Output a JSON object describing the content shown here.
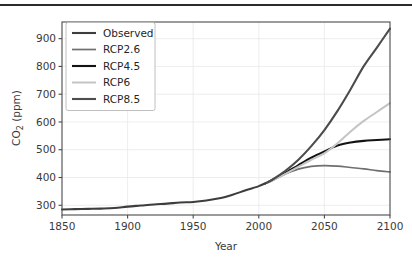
{
  "figure": {
    "background_color": "#ffffff",
    "top_rule_color": "#2b2b2b"
  },
  "chart_data": {
    "type": "line",
    "title": "",
    "xlabel": "Year",
    "ylabel": "CO₂ (ppm)",
    "xlim": [
      1850,
      2100
    ],
    "ylim": [
      265,
      960
    ],
    "xticks": [
      1850,
      1900,
      1950,
      2000,
      2050,
      2100
    ],
    "xticklabels": [
      "1850",
      "1900",
      "1950",
      "2000",
      "2050",
      "2100"
    ],
    "yticks": [
      300,
      400,
      500,
      600,
      700,
      800,
      900
    ],
    "yticklabels": [
      "300",
      "400",
      "500",
      "600",
      "700",
      "800",
      "900"
    ],
    "grid": true,
    "grid_color": "#e9e9e9",
    "legend_position": "upper left",
    "x": [
      1850,
      1860,
      1870,
      1880,
      1890,
      1900,
      1910,
      1920,
      1930,
      1940,
      1950,
      1960,
      1970,
      1980,
      1990,
      2000,
      2005,
      2010,
      2020,
      2030,
      2040,
      2050,
      2060,
      2070,
      2080,
      2090,
      2100
    ],
    "series": [
      {
        "name": "Observed",
        "color": "#3d3d3d",
        "linewidth": 2.1,
        "x": [
          1850,
          1860,
          1870,
          1880,
          1890,
          1900,
          1910,
          1920,
          1930,
          1940,
          1950,
          1960,
          1970,
          1980,
          1990,
          2000,
          2005
        ],
        "values": [
          285,
          286,
          287,
          288,
          290,
          295,
          299,
          303,
          306,
          310,
          312,
          317,
          325,
          338,
          354,
          369,
          379
        ]
      },
      {
        "name": "RCP2.6",
        "color": "#6f6f6f",
        "linewidth": 1.7,
        "x": [
          2005,
          2010,
          2020,
          2030,
          2040,
          2050,
          2060,
          2070,
          2080,
          2090,
          2100
        ],
        "values": [
          379,
          389,
          412,
          430,
          440,
          443,
          441,
          436,
          431,
          425,
          420
        ]
      },
      {
        "name": "RCP4.5",
        "color": "#131313",
        "linewidth": 2.1,
        "x": [
          2005,
          2010,
          2020,
          2030,
          2040,
          2050,
          2060,
          2070,
          2080,
          2090,
          2100
        ],
        "values": [
          379,
          390,
          416,
          444,
          471,
          494,
          515,
          526,
          532,
          535,
          538
        ]
      },
      {
        "name": "RCP6",
        "color": "#c4c4c4",
        "linewidth": 2.0,
        "x": [
          2005,
          2010,
          2020,
          2030,
          2040,
          2050,
          2060,
          2070,
          2080,
          2090,
          2100
        ],
        "values": [
          379,
          389,
          412,
          438,
          464,
          487,
          523,
          566,
          604,
          636,
          668
        ]
      },
      {
        "name": "RCP8.5",
        "color": "#4c4c4c",
        "linewidth": 2.1,
        "x": [
          2005,
          2010,
          2020,
          2030,
          2040,
          2050,
          2060,
          2070,
          2080,
          2090,
          2100
        ],
        "values": [
          379,
          391,
          423,
          463,
          513,
          571,
          640,
          718,
          801,
          868,
          936
        ]
      }
    ],
    "legend_entries": [
      {
        "label": "Observed",
        "color": "#3d3d3d"
      },
      {
        "label": "RCP2.6",
        "color": "#6f6f6f"
      },
      {
        "label": "RCP4.5",
        "color": "#131313"
      },
      {
        "label": "RCP6",
        "color": "#c4c4c4"
      },
      {
        "label": "RCP8.5",
        "color": "#4c4c4c"
      }
    ]
  }
}
